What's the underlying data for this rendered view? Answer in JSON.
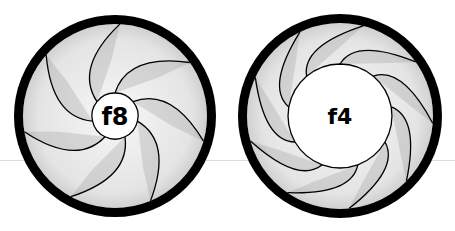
{
  "diagram": {
    "type": "aperture-comparison",
    "apertures": [
      {
        "label": "f8",
        "center": [
          115,
          116
        ],
        "ring_outer_radius": 101,
        "ring_width": 9,
        "opening_radius": 23,
        "blade_count": 7,
        "label_font_size": 24
      },
      {
        "label": "f4",
        "center": [
          340,
          116
        ],
        "ring_outer_radius": 102,
        "ring_width": 9,
        "opening_radius": 52,
        "blade_count": 9,
        "label_font_size": 22
      }
    ],
    "colors": {
      "ring": "#000000",
      "blade_fill": "#ececec",
      "blade_shadow": "#8a8a8a",
      "blade_edge": "#000000",
      "opening": "#ffffff",
      "guide_line": "#cfcfcf"
    }
  }
}
